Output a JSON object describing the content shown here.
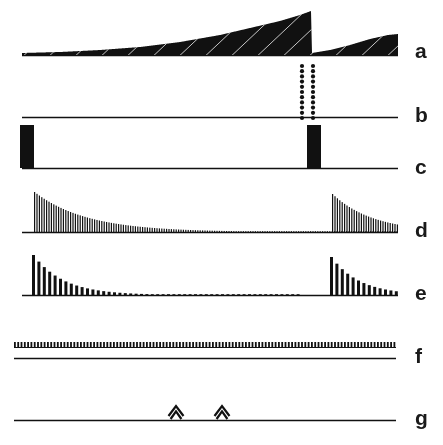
{
  "figure": {
    "type": "multi-trace-recording",
    "width": 443,
    "height": 445,
    "background_color": "#ffffff",
    "ink_color": "#111111",
    "label_color": "#1a1a1a",
    "bottom_cropped_text": "",
    "traces": [
      {
        "id": "a",
        "label": "a",
        "label_y": 40,
        "baseline_y": 55,
        "x_start": 22,
        "x_end": 398,
        "kind": "ramping-dense-oscillation",
        "description": "Dense high-frequency activity whose envelope ramps up slowly to a maximum then drops abruptly and ramps again",
        "envelope": [
          {
            "x": 22,
            "amplitude": 2
          },
          {
            "x": 60,
            "amplitude": 3
          },
          {
            "x": 100,
            "amplitude": 5
          },
          {
            "x": 140,
            "amplitude": 8
          },
          {
            "x": 180,
            "amplitude": 13
          },
          {
            "x": 220,
            "amplitude": 20
          },
          {
            "x": 250,
            "amplitude": 27
          },
          {
            "x": 280,
            "amplitude": 34
          },
          {
            "x": 300,
            "amplitude": 40
          },
          {
            "x": 311,
            "amplitude": 44
          },
          {
            "x": 312,
            "amplitude": 2
          },
          {
            "x": 330,
            "amplitude": 5
          },
          {
            "x": 350,
            "amplitude": 10
          },
          {
            "x": 370,
            "amplitude": 16
          },
          {
            "x": 388,
            "amplitude": 20
          },
          {
            "x": 398,
            "amplitude": 21
          }
        ]
      },
      {
        "id": "b",
        "label": "b",
        "label_y": 104,
        "baseline_y": 117,
        "x_start": 22,
        "x_end": 398,
        "kind": "dotted-raster-burst",
        "description": "Flat baseline with a single vertical raster burst of two dotted columns",
        "burst": {
          "x_columns": [
            302,
            313
          ],
          "dot_count": 11,
          "dot_radius": 2.1,
          "top_y": 66,
          "bottom_y": 118
        }
      },
      {
        "id": "c",
        "label": "c",
        "label_y": 156,
        "baseline_y": 168,
        "x_start": 22,
        "x_end": 398,
        "kind": "square-pulse",
        "description": "Two tall solid rectangular pulses marking stimulus onset events",
        "pulses": [
          {
            "x": 20,
            "width": 14,
            "height": 43
          },
          {
            "x": 307,
            "width": 14,
            "height": 43
          }
        ]
      },
      {
        "id": "d",
        "label": "d",
        "label_y": 219,
        "baseline_y": 232,
        "x_start": 22,
        "x_end": 398,
        "kind": "decaying-spike-train-dense",
        "description": "Two bursts of densely packed spikes with exponentially decaying amplitude",
        "bursts": [
          {
            "onset_x": 34,
            "peak_amplitude": 40,
            "decay_constant": 52,
            "spike_spacing": 2.4,
            "spike_width": 1.2,
            "end_x": 398
          },
          {
            "onset_x": 332,
            "peak_amplitude": 38,
            "decay_constant": 40,
            "spike_spacing": 2.4,
            "spike_width": 1.2,
            "end_x": 398
          }
        ]
      },
      {
        "id": "e",
        "label": "e",
        "label_y": 282,
        "baseline_y": 295,
        "x_start": 22,
        "x_end": 398,
        "kind": "decaying-spike-train-sparse",
        "description": "Two bursts of wider, more widely spaced spikes with exponential amplitude decay",
        "bursts": [
          {
            "onset_x": 32,
            "peak_amplitude": 40,
            "decay_constant": 30,
            "spike_spacing": 5.4,
            "spike_width": 3.0,
            "end_x": 300
          },
          {
            "onset_x": 330,
            "peak_amplitude": 38,
            "decay_constant": 28,
            "spike_spacing": 5.4,
            "spike_width": 3.0,
            "end_x": 398
          }
        ]
      },
      {
        "id": "f",
        "label": "f",
        "label_y": 345,
        "baseline_y": 358,
        "x_start": 14,
        "x_end": 396,
        "kind": "continuous-regular-spike-train",
        "description": "Uniform low-amplitude regular spike train running the entire sweep, drawn above a second flat baseline",
        "spike_train": {
          "amplitude": 5,
          "spacing": 3.3,
          "spike_width": 1.8,
          "top_offset": -11
        },
        "second_baseline_offset": 0
      },
      {
        "id": "g",
        "label": "g",
        "label_y": 407,
        "baseline_y": 420,
        "x_start": 14,
        "x_end": 396,
        "kind": "flat-with-markers",
        "description": "Flat baseline with two chevron (caret) event markers",
        "markers": [
          {
            "x": 176,
            "type": "double-chevron-up",
            "width": 15,
            "height": 16
          },
          {
            "x": 222,
            "type": "double-chevron-up",
            "width": 15,
            "height": 16
          }
        ]
      }
    ]
  }
}
